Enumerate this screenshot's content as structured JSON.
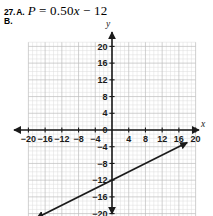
{
  "problem": {
    "number": "27.",
    "part_a_letter": "A.",
    "equation_lhs": "P",
    "equation_eq": "=",
    "equation_slope": "0.50",
    "equation_var": "x",
    "equation_minus": "−",
    "equation_intercept": "12",
    "equation_full": "P = 0.50x − 12",
    "part_b_letter": "B."
  },
  "chart_data": {
    "type": "line",
    "title": "",
    "xlabel": "x",
    "ylabel": "y",
    "xlim": [
      -21,
      21
    ],
    "ylim": [
      -21,
      21
    ],
    "grid": true,
    "grid_step": 1,
    "major_step": 4,
    "legend": "none",
    "x_ticks": [
      -20,
      -16,
      -12,
      -8,
      -4,
      4,
      8,
      12,
      16,
      20
    ],
    "x_tick_labels": [
      "−20",
      "−16",
      "−12",
      "−8",
      "−4",
      "4",
      "8",
      "12",
      "16",
      "20"
    ],
    "y_ticks": [
      20,
      16,
      12,
      8,
      4,
      0,
      -4,
      -8,
      -12,
      -16,
      -20
    ],
    "y_tick_labels": [
      "20",
      "16",
      "12",
      "8",
      "4",
      "0",
      "−4",
      "−8",
      "−12",
      "−16",
      "−20"
    ],
    "series": [
      {
        "name": "P = 0.50x − 12",
        "slope": 0.5,
        "intercept": -12,
        "arrows": "both",
        "x_endpoints": [
          -18,
          18
        ],
        "y_endpoints": [
          -21,
          -3
        ],
        "color": "#1a1a1a",
        "points": [
          {
            "x": -18,
            "y": -21
          },
          {
            "x": -12,
            "y": -18
          },
          {
            "x": -8,
            "y": -16
          },
          {
            "x": -4,
            "y": -14
          },
          {
            "x": 0,
            "y": -12
          },
          {
            "x": 4,
            "y": -10
          },
          {
            "x": 8,
            "y": -8
          },
          {
            "x": 12,
            "y": -6
          },
          {
            "x": 16,
            "y": -4
          },
          {
            "x": 18,
            "y": -3
          }
        ]
      }
    ],
    "colors": {
      "grid_minor": "#dcdcdc",
      "grid_major": "#bdbdbd",
      "axis": "#1a1a1a",
      "line": "#1a1a1a"
    }
  }
}
